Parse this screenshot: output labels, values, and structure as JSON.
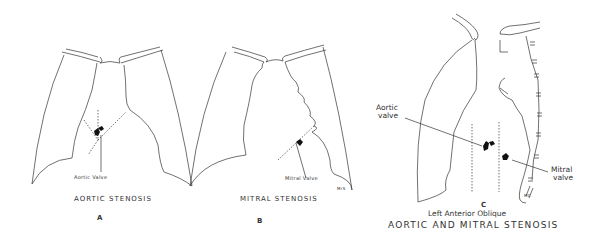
{
  "figures": [
    {
      "id": "A",
      "letter": "A",
      "title": "AORTIC STENOSIS",
      "valve_label": "Aortic Valve"
    },
    {
      "id": "B",
      "letter": "B",
      "title": "MITRAL STENOSIS",
      "valve_label": "Mitral Valve",
      "initials": "MrS"
    },
    {
      "id": "C",
      "letter": "C",
      "view_label": "Left Anterior Oblique",
      "title": "AORTIC AND MITRAL STENOSIS",
      "aortic_label_line1": "Aortic",
      "aortic_label_line2": "valve",
      "mitral_label_line1": "Mitral",
      "mitral_label_line2": "valve",
      "initials": "MC"
    }
  ],
  "colors": {
    "line": "#333333",
    "calcification": "#111111",
    "background": "#ffffff"
  }
}
